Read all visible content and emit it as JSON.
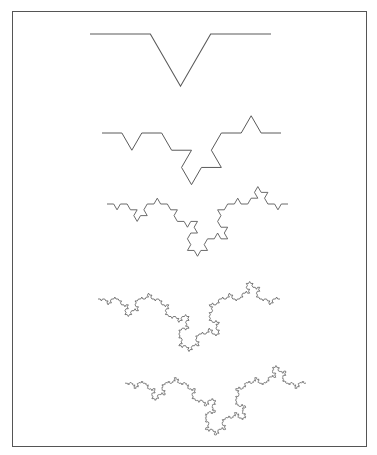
{
  "figure": {
    "frame": {
      "x": 12,
      "y": 11,
      "width": 355,
      "height": 436,
      "border_color": "#555555"
    },
    "stroke_color": "#5a5a5a",
    "rule": {
      "angle_deg": 60,
      "subdivisions": 4,
      "child_orientation": [
        1,
        -1,
        1,
        -1
      ],
      "initial_dip": "down"
    },
    "generations": [
      {
        "level": 1,
        "start": [
          90,
          34
        ],
        "end": [
          271,
          34
        ],
        "stroke_width": 1.1
      },
      {
        "level": 2,
        "start": [
          102,
          133
        ],
        "end": [
          281,
          133
        ],
        "stroke_width": 1.0
      },
      {
        "level": 3,
        "start": [
          107,
          204
        ],
        "end": [
          288,
          204
        ],
        "stroke_width": 0.9
      },
      {
        "level": 4,
        "start": [
          98,
          299
        ],
        "end": [
          280,
          299
        ],
        "stroke_width": 0.8
      },
      {
        "level": 5,
        "start": [
          125,
          383
        ],
        "end": [
          306,
          383
        ],
        "stroke_width": 0.7
      }
    ]
  }
}
